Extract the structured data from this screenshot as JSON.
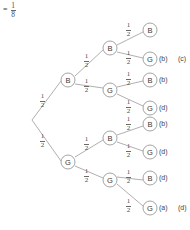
{
  "figure": {
    "type": "probability-tree-diagram",
    "width": 190,
    "height": 230,
    "result_expression": {
      "equals_sign": "=",
      "numerator": "1",
      "denominator": "8"
    },
    "branch_probability": {
      "numerator": "1",
      "denominator": "2"
    },
    "levels": 3,
    "level1": [
      {
        "id": "n-b",
        "label": "B",
        "prob_num": "1",
        "prob_den": "2",
        "cx": 68,
        "cy": 80
      },
      {
        "id": "n-g",
        "label": "G",
        "prob_num": "1",
        "prob_den": "2",
        "cx": 68,
        "cy": 162
      }
    ],
    "level2": [
      {
        "id": "n-bb",
        "label": "B",
        "prob_num": "1",
        "prob_den": "2",
        "cx": 110,
        "cy": 48,
        "parent": "n-b"
      },
      {
        "id": "n-bg",
        "label": "G",
        "prob_num": "1",
        "prob_den": "2",
        "cx": 110,
        "cy": 90,
        "parent": "n-b"
      },
      {
        "id": "n-gb",
        "label": "B",
        "prob_num": "1",
        "prob_den": "2",
        "cx": 110,
        "cy": 138,
        "parent": "n-g"
      },
      {
        "id": "n-gg",
        "label": "G",
        "prob_num": "1",
        "prob_den": "2",
        "cx": 110,
        "cy": 180,
        "parent": "n-g"
      }
    ],
    "leaves": [
      {
        "id": "leaf-1",
        "label": "B",
        "prob_num": "1",
        "prob_den": "2",
        "cx": 150,
        "cy": 30,
        "parent": "n-bb",
        "annotations": []
      },
      {
        "id": "leaf-2",
        "label": "G",
        "prob_num": "1",
        "prob_den": "2",
        "cx": 150,
        "cy": 59,
        "parent": "n-bb",
        "annotations": [
          "(b)",
          "(c)"
        ]
      },
      {
        "id": "leaf-3",
        "label": "B",
        "prob_num": "1",
        "prob_den": "2",
        "cx": 150,
        "cy": 80,
        "parent": "n-bg",
        "annotations": [
          "(b)"
        ]
      },
      {
        "id": "leaf-4",
        "label": "G",
        "prob_num": "1",
        "prob_den": "2",
        "cx": 150,
        "cy": 108,
        "parent": "n-bg",
        "annotations": [
          "(d)"
        ]
      },
      {
        "id": "leaf-5",
        "label": "B",
        "prob_num": "1",
        "prob_den": "2",
        "cx": 150,
        "cy": 124,
        "parent": "n-gb",
        "annotations": [
          "(b)"
        ]
      },
      {
        "id": "leaf-6",
        "label": "G",
        "prob_num": "1",
        "prob_den": "2",
        "cx": 150,
        "cy": 152,
        "parent": "n-gb",
        "annotations": [
          "(d)"
        ]
      },
      {
        "id": "leaf-7",
        "label": "B",
        "prob_num": "1",
        "prob_den": "2",
        "cx": 150,
        "cy": 178,
        "parent": "n-gg",
        "annotations": [
          "(d)"
        ]
      },
      {
        "id": "leaf-8",
        "label": "G",
        "prob_num": "1",
        "prob_den": "2",
        "cx": 150,
        "cy": 208,
        "parent": "n-gg",
        "annotations": [
          "(a)",
          "(d)"
        ]
      }
    ],
    "colors": {
      "stroke": "#9a9a9a",
      "text": "#3f3f3f",
      "background": "#ffffff"
    }
  }
}
